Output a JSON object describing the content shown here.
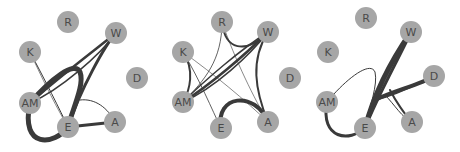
{
  "diagram": {
    "type": "network-graph-small-multiples",
    "node_radius": 11,
    "node_color": "#a6a6a6",
    "edge_color": "#3a3a3a",
    "panels": [
      {
        "id": "panel-1",
        "nodes": [
          {
            "id": "R",
            "label": "R",
            "x": 68,
            "y": 22
          },
          {
            "id": "W",
            "label": "W",
            "x": 116,
            "y": 33
          },
          {
            "id": "K",
            "label": "K",
            "x": 30,
            "y": 52
          },
          {
            "id": "D",
            "label": "D",
            "x": 137,
            "y": 78
          },
          {
            "id": "AM",
            "label": "AM",
            "x": 30,
            "y": 103
          },
          {
            "id": "E",
            "label": "E",
            "x": 68,
            "y": 127
          },
          {
            "id": "A",
            "label": "A",
            "x": 115,
            "y": 122
          }
        ],
        "edges": [
          {
            "d": "M30,103 C20,150 55,145 68,127",
            "w": 5
          },
          {
            "d": "M30,103 C50,80 75,60 80,72 C85,85 72,110 68,127",
            "w": 5
          },
          {
            "d": "M30,103 C55,80 95,50 116,33",
            "w": 2.5
          },
          {
            "d": "M30,103 C60,90 100,55 116,33",
            "w": 1.5
          },
          {
            "d": "M68,127 C80,90 105,45 116,33",
            "w": 3
          },
          {
            "d": "M30,52 C45,80 60,110 68,127",
            "w": 1
          },
          {
            "d": "M30,52 C45,85 58,110 68,127",
            "w": 0.6
          },
          {
            "d": "M68,127 L115,122",
            "w": 3
          },
          {
            "d": "M80,100 C95,98 108,108 115,122",
            "w": 1
          }
        ]
      },
      {
        "id": "panel-2",
        "nodes": [
          {
            "id": "R",
            "label": "R",
            "x": 222,
            "y": 22
          },
          {
            "id": "W",
            "label": "W",
            "x": 268,
            "y": 32
          },
          {
            "id": "K",
            "label": "K",
            "x": 183,
            "y": 52
          },
          {
            "id": "D",
            "label": "D",
            "x": 290,
            "y": 78
          },
          {
            "id": "AM",
            "label": "AM",
            "x": 183,
            "y": 102
          },
          {
            "id": "E",
            "label": "E",
            "x": 221,
            "y": 128
          },
          {
            "id": "A",
            "label": "A",
            "x": 268,
            "y": 122
          }
        ],
        "edges": [
          {
            "d": "M183,102 C210,85 245,55 268,32",
            "w": 2.5
          },
          {
            "d": "M183,102 C215,88 250,55 268,32",
            "w": 1.5
          },
          {
            "d": "M183,102 C205,80 240,50 268,32",
            "w": 1.5
          },
          {
            "d": "M183,52 C195,70 190,90 183,102",
            "w": 2
          },
          {
            "d": "M222,22 C225,50 245,55 268,32",
            "w": 2
          },
          {
            "d": "M268,32 C250,60 255,90 268,122",
            "w": 2
          },
          {
            "d": "M221,128 C215,95 255,90 268,122",
            "w": 4
          },
          {
            "d": "M222,22 C222,60 205,80 183,102",
            "w": 0.8
          },
          {
            "d": "M183,52 C200,80 212,110 221,128",
            "w": 0.8
          },
          {
            "d": "M183,52 C215,75 245,100 268,122",
            "w": 0.6
          },
          {
            "d": "M222,22 C235,60 255,100 268,122",
            "w": 0.6
          }
        ]
      },
      {
        "id": "panel-3",
        "nodes": [
          {
            "id": "R",
            "label": "R",
            "x": 366,
            "y": 18
          },
          {
            "id": "W",
            "label": "W",
            "x": 411,
            "y": 32
          },
          {
            "id": "K",
            "label": "K",
            "x": 328,
            "y": 52
          },
          {
            "id": "D",
            "label": "D",
            "x": 434,
            "y": 76
          },
          {
            "id": "AM",
            "label": "AM",
            "x": 327,
            "y": 102
          },
          {
            "id": "E",
            "label": "E",
            "x": 365,
            "y": 128
          },
          {
            "id": "A",
            "label": "A",
            "x": 412,
            "y": 122
          }
        ],
        "edges": [
          {
            "d": "M365,128 C375,90 395,55 411,32",
            "w": 5
          },
          {
            "d": "M365,128 C378,95 398,60 411,32",
            "w": 3
          },
          {
            "d": "M327,102 C320,140 350,142 365,128",
            "w": 3
          },
          {
            "d": "M327,102 C345,80 370,60 375,72 C378,85 370,105 365,128",
            "w": 1
          },
          {
            "d": "M375,100 C395,90 420,85 434,76",
            "w": 4
          },
          {
            "d": "M375,100 C400,95 420,82 434,76",
            "w": 1.5
          },
          {
            "d": "M390,90 C395,100 405,115 412,122",
            "w": 2
          },
          {
            "d": "M385,95 C395,105 402,118 412,122",
            "w": 1
          }
        ]
      }
    ]
  }
}
